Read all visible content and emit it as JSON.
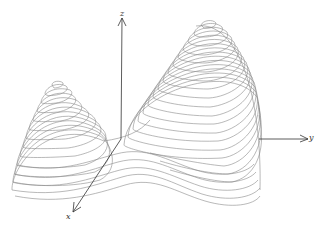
{
  "figure": {
    "axes": {
      "x": {
        "label": "x"
      },
      "y": {
        "label": "y"
      },
      "z": {
        "label": "z"
      }
    },
    "surface": {
      "left_peak": {
        "relative_height": "lower",
        "contour_count": 14
      },
      "right_peak": {
        "relative_height": "higher",
        "contour_count": 20
      }
    },
    "colors": {
      "axis": "#333333",
      "contour": "#8a8a8a",
      "background": "#ffffff"
    }
  }
}
